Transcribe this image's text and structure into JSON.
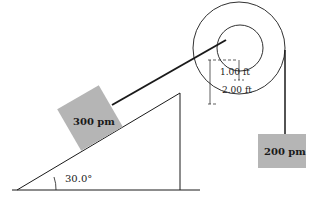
{
  "diagram": {
    "blocks": {
      "incline_block": {
        "label": "300 pm"
      },
      "hanging_block": {
        "label": "200 pm"
      }
    },
    "incline": {
      "angle_label": "30.0°"
    },
    "pulley": {
      "inner_radius_label": "1.00 ft",
      "outer_radius_label": "2.00 ft"
    },
    "colors": {
      "block_fill": "#b5b5b5",
      "line": "#1a1a1a",
      "background": "#ffffff"
    }
  }
}
